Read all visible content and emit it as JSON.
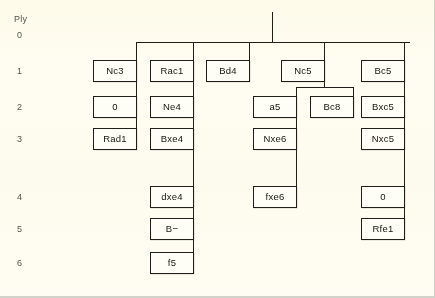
{
  "axis": {
    "title": "Ply",
    "labels": [
      {
        "text": "0",
        "y": 30
      },
      {
        "text": "1",
        "y": 66
      },
      {
        "text": "2",
        "y": 102
      },
      {
        "text": "3",
        "y": 134
      },
      {
        "text": "4",
        "y": 192
      },
      {
        "text": "5",
        "y": 224
      },
      {
        "text": "6",
        "y": 258
      }
    ]
  },
  "tree": {
    "root": {
      "name": "root-stub",
      "label": ""
    },
    "nodes": [
      {
        "id": "n-nc3",
        "label": "Nc3",
        "ply": 1,
        "x": 115,
        "y": 60,
        "w": 44,
        "h": 22
      },
      {
        "id": "n-rac1",
        "label": "Rac1",
        "ply": 1,
        "x": 172,
        "y": 60,
        "w": 44,
        "h": 22
      },
      {
        "id": "n-bd4",
        "label": "Bd4",
        "ply": 1,
        "x": 228,
        "y": 60,
        "w": 44,
        "h": 22
      },
      {
        "id": "n-nc5",
        "label": "Nc5",
        "ply": 1,
        "x": 303,
        "y": 60,
        "w": 44,
        "h": 22
      },
      {
        "id": "n-bc5",
        "label": "Bc5",
        "ply": 1,
        "x": 383,
        "y": 60,
        "w": 44,
        "h": 22
      },
      {
        "id": "n-0a",
        "label": "0",
        "ply": 2,
        "x": 115,
        "y": 96,
        "w": 44,
        "h": 22
      },
      {
        "id": "n-ne4",
        "label": "Ne4",
        "ply": 2,
        "x": 172,
        "y": 96,
        "w": 44,
        "h": 22
      },
      {
        "id": "n-a5",
        "label": "a5",
        "ply": 2,
        "x": 275,
        "y": 96,
        "w": 44,
        "h": 22
      },
      {
        "id": "n-bc8",
        "label": "Bc8",
        "ply": 2,
        "x": 332,
        "y": 96,
        "w": 44,
        "h": 22
      },
      {
        "id": "n-bxc5",
        "label": "Bxc5",
        "ply": 2,
        "x": 383,
        "y": 96,
        "w": 44,
        "h": 22
      },
      {
        "id": "n-rad1",
        "label": "Rad1",
        "ply": 3,
        "x": 115,
        "y": 128,
        "w": 44,
        "h": 22
      },
      {
        "id": "n-bxe4",
        "label": "Bxe4",
        "ply": 3,
        "x": 172,
        "y": 128,
        "w": 44,
        "h": 22
      },
      {
        "id": "n-nxe6",
        "label": "Nxe6",
        "ply": 3,
        "x": 275,
        "y": 128,
        "w": 44,
        "h": 22
      },
      {
        "id": "n-nxc5",
        "label": "Nxc5",
        "ply": 3,
        "x": 383,
        "y": 128,
        "w": 44,
        "h": 22
      },
      {
        "id": "n-dxe4",
        "label": "dxe4",
        "ply": 4,
        "x": 172,
        "y": 186,
        "w": 44,
        "h": 22
      },
      {
        "id": "n-fxe6",
        "label": "fxe6",
        "ply": 4,
        "x": 275,
        "y": 186,
        "w": 44,
        "h": 22
      },
      {
        "id": "n-0b",
        "label": "0",
        "ply": 4,
        "x": 383,
        "y": 186,
        "w": 44,
        "h": 22
      },
      {
        "id": "n-bminus",
        "label": "B−",
        "ply": 5,
        "x": 172,
        "y": 218,
        "w": 44,
        "h": 22
      },
      {
        "id": "n-rfe1",
        "label": "Rfe1",
        "ply": 5,
        "x": 383,
        "y": 218,
        "w": 44,
        "h": 22
      },
      {
        "id": "n-f5",
        "label": "f5",
        "ply": 6,
        "x": 172,
        "y": 252,
        "w": 44,
        "h": 22
      }
    ],
    "edges": [
      {
        "type": "v",
        "name": "edge-root-stem",
        "x": 272,
        "y": 12,
        "len": 30
      },
      {
        "type": "h",
        "name": "edge-root-bus",
        "x": 136,
        "y": 42,
        "len": 274
      },
      {
        "type": "v",
        "name": "edge-root-to-nc3",
        "x": 136,
        "y": 42,
        "len": 18
      },
      {
        "type": "v",
        "name": "edge-root-to-rac1",
        "x": 193,
        "y": 42,
        "len": 18
      },
      {
        "type": "v",
        "name": "edge-root-to-bd4",
        "x": 249,
        "y": 42,
        "len": 18
      },
      {
        "type": "v",
        "name": "edge-root-to-nc5",
        "x": 324,
        "y": 42,
        "len": 18
      },
      {
        "type": "v",
        "name": "edge-root-to-bc5",
        "x": 404,
        "y": 42,
        "len": 18
      },
      {
        "type": "v",
        "name": "edge-nc3-to-0a",
        "x": 136,
        "y": 82,
        "len": 14
      },
      {
        "type": "v",
        "name": "edge-rac1-to-ne4",
        "x": 193,
        "y": 82,
        "len": 14
      },
      {
        "type": "v",
        "name": "edge-bc5-to-bxc5",
        "x": 404,
        "y": 82,
        "len": 14
      },
      {
        "type": "h",
        "name": "edge-nc5-bus",
        "x": 296,
        "y": 87,
        "len": 57
      },
      {
        "type": "v",
        "name": "edge-nc5-stem",
        "x": 324,
        "y": 82,
        "len": 5
      },
      {
        "type": "v",
        "name": "edge-nc5-to-a5",
        "x": 296,
        "y": 87,
        "len": 10
      },
      {
        "type": "v",
        "name": "edge-nc5-to-bc8",
        "x": 353,
        "y": 87,
        "len": 10
      },
      {
        "type": "v",
        "name": "edge-0a-to-rad1",
        "x": 136,
        "y": 118,
        "len": 11
      },
      {
        "type": "v",
        "name": "edge-ne4-to-bxe4",
        "x": 193,
        "y": 118,
        "len": 11
      },
      {
        "type": "v",
        "name": "edge-a5-to-nxe6",
        "x": 296,
        "y": 118,
        "len": 11
      },
      {
        "type": "v",
        "name": "edge-bxc5-to-nxc5",
        "x": 404,
        "y": 118,
        "len": 11
      },
      {
        "type": "v",
        "name": "edge-bxe4-to-dxe4",
        "x": 193,
        "y": 150,
        "len": 37
      },
      {
        "type": "v",
        "name": "edge-nxe6-to-fxe6",
        "x": 296,
        "y": 150,
        "len": 37
      },
      {
        "type": "v",
        "name": "edge-nxc5-to-0b",
        "x": 404,
        "y": 150,
        "len": 37
      },
      {
        "type": "v",
        "name": "edge-dxe4-to-bminus",
        "x": 193,
        "y": 208,
        "len": 11
      },
      {
        "type": "v",
        "name": "edge-0b-to-rfe1",
        "x": 404,
        "y": 208,
        "len": 11
      },
      {
        "type": "v",
        "name": "edge-bminus-to-f5",
        "x": 193,
        "y": 240,
        "len": 13
      }
    ]
  }
}
